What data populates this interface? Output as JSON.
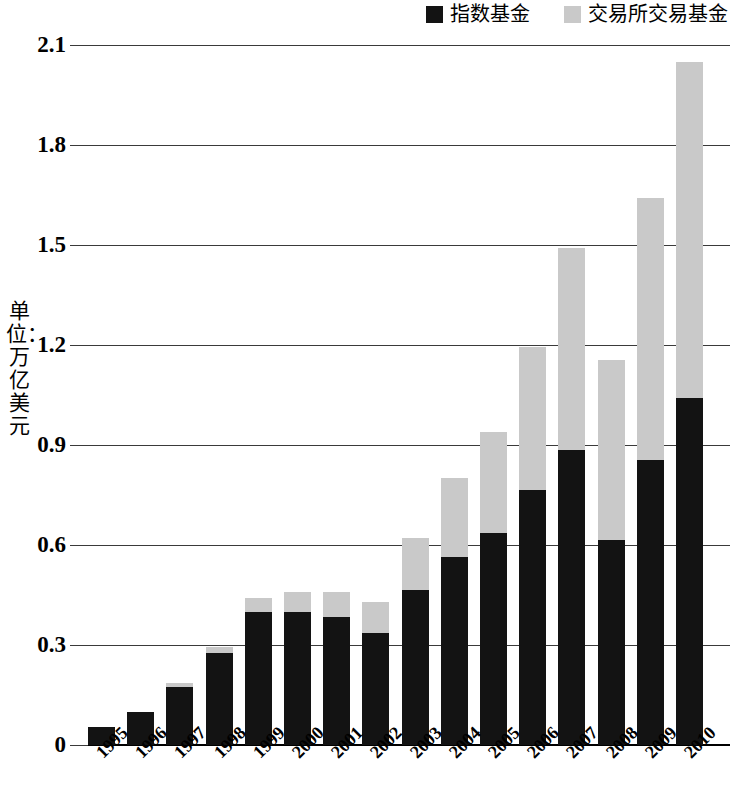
{
  "legend": {
    "items": [
      {
        "label": "指数基金",
        "color": "#131313",
        "key": "index_funds"
      },
      {
        "label": "交易所交易基金",
        "color": "#c9c9c9",
        "key": "etf"
      }
    ]
  },
  "axis": {
    "y_title": "单位：万亿美元",
    "y_ticks": [
      "0",
      "0.3",
      "0.6",
      "0.9",
      "1.2",
      "1.5",
      "1.8",
      "2.1"
    ]
  },
  "chart_data": {
    "type": "bar",
    "stacked": true,
    "title": "",
    "xlabel": "",
    "ylabel": "单位：万亿美元",
    "ylim": [
      0,
      2.1
    ],
    "ytick_values": [
      0,
      0.3,
      0.6,
      0.9,
      1.2,
      1.5,
      1.8,
      2.1
    ],
    "grid": true,
    "legend_position": "top-right",
    "categories": [
      "1995",
      "1996",
      "1997",
      "1998",
      "1999",
      "2000",
      "2001",
      "2002",
      "2003",
      "2004",
      "2005",
      "2006",
      "2007",
      "2008",
      "2009",
      "2010"
    ],
    "series": [
      {
        "name": "指数基金",
        "color": "#131313",
        "values": [
          0.055,
          0.1,
          0.175,
          0.275,
          0.4,
          0.4,
          0.385,
          0.335,
          0.465,
          0.565,
          0.635,
          0.765,
          0.885,
          0.615,
          0.855,
          1.04
        ]
      },
      {
        "name": "交易所交易基金",
        "color": "#c9c9c9",
        "values": [
          0.0,
          0.0,
          0.01,
          0.02,
          0.04,
          0.06,
          0.075,
          0.095,
          0.155,
          0.235,
          0.305,
          0.43,
          0.605,
          0.54,
          0.785,
          1.01
        ]
      }
    ],
    "totals": [
      0.055,
      0.1,
      0.185,
      0.295,
      0.44,
      0.46,
      0.46,
      0.43,
      0.62,
      0.8,
      0.94,
      1.195,
      1.49,
      1.155,
      1.64,
      2.05
    ]
  }
}
